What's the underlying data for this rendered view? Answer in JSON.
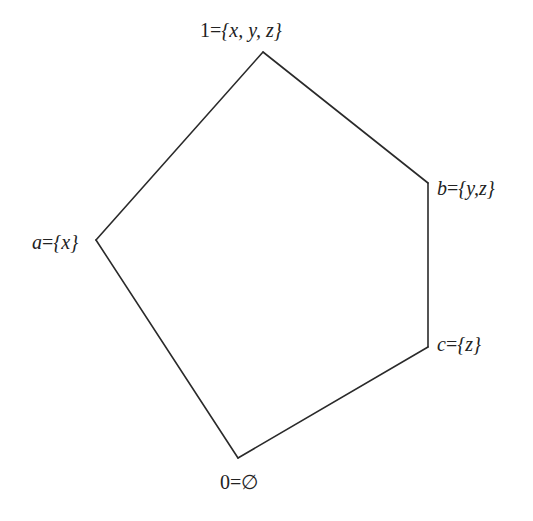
{
  "diagram": {
    "type": "lattice-hasse-diagram",
    "stroke_color": "#2a2a2a",
    "nodes": [
      {
        "id": "top",
        "label_prefix": "1",
        "label_set": "{x, y, z}",
        "x": 263,
        "y": 52,
        "label_x": 200,
        "label_y": 20
      },
      {
        "id": "b",
        "label_prefix": "b",
        "label_set": "{y,z}",
        "x": 428,
        "y": 183,
        "label_x": 437,
        "label_y": 178
      },
      {
        "id": "a",
        "label_prefix": "a",
        "label_set": "{x}",
        "x": 96,
        "y": 240,
        "label_x": 32,
        "label_y": 232
      },
      {
        "id": "c",
        "label_prefix": "c",
        "label_set": "{z}",
        "x": 428,
        "y": 347,
        "label_x": 437,
        "label_y": 333
      },
      {
        "id": "bottom",
        "label_prefix": "0",
        "label_set": "∅",
        "x": 238,
        "y": 458,
        "label_x": 220,
        "label_y": 473
      }
    ],
    "edges": [
      [
        "top",
        "b"
      ],
      [
        "b",
        "c"
      ],
      [
        "c",
        "bottom"
      ],
      [
        "bottom",
        "a"
      ],
      [
        "a",
        "top"
      ]
    ]
  },
  "labels": {
    "top": {
      "prefix": "1",
      "eq": "=",
      "set": "{x, y, z}"
    },
    "b": {
      "prefix": "b",
      "eq": "=",
      "set": "{y,z}"
    },
    "a": {
      "prefix": "a",
      "eq": "=",
      "set": "{x}"
    },
    "c": {
      "prefix": "c",
      "eq": "=",
      "set": "{z}"
    },
    "bottom": {
      "prefix": "0",
      "eq": "=",
      "set": "∅"
    }
  }
}
